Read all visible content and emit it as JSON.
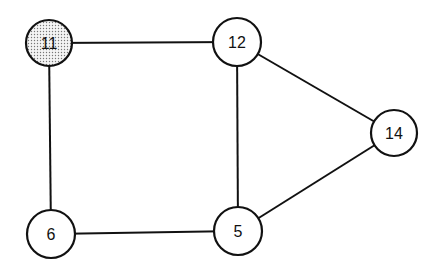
{
  "diagram": {
    "type": "undirected-graph",
    "nodes": [
      {
        "id": "11",
        "label": "11",
        "x": 49,
        "y": 43,
        "r": 23,
        "shaded": true
      },
      {
        "id": "12",
        "label": "12",
        "x": 237,
        "y": 42,
        "r": 24,
        "shaded": false
      },
      {
        "id": "14",
        "label": "14",
        "x": 394,
        "y": 133,
        "r": 23,
        "shaded": false
      },
      {
        "id": "6",
        "label": "6",
        "x": 51,
        "y": 234,
        "r": 24,
        "shaded": false
      },
      {
        "id": "5",
        "label": "5",
        "x": 238,
        "y": 231,
        "r": 24,
        "shaded": false
      }
    ],
    "edges": [
      {
        "from": "11",
        "to": "12"
      },
      {
        "from": "11",
        "to": "6"
      },
      {
        "from": "12",
        "to": "5"
      },
      {
        "from": "12",
        "to": "14"
      },
      {
        "from": "14",
        "to": "5"
      },
      {
        "from": "6",
        "to": "5"
      }
    ],
    "colors": {
      "stroke": "#111111",
      "fill": "#ffffff",
      "shaded_fill": "#d9d9d9"
    }
  }
}
